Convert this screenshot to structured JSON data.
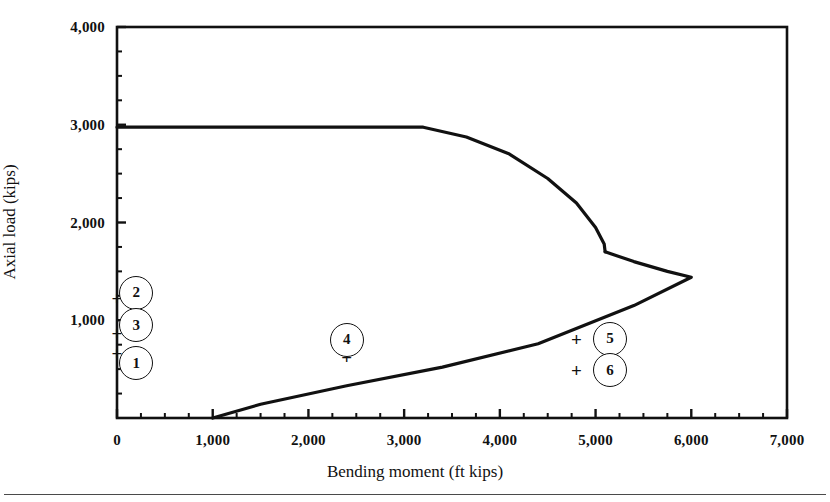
{
  "chart_data": {
    "type": "line",
    "title": "",
    "subtitle": "",
    "xlabel": "Bending moment (ft kips)",
    "ylabel": "Axial load (kips)",
    "xlim": [
      0,
      7000
    ],
    "ylim": [
      0,
      4000
    ],
    "xticks": [
      0,
      1000,
      2000,
      3000,
      4000,
      5000,
      6000,
      7000
    ],
    "xtick_labels": [
      "0",
      "1,000",
      "2,000",
      "3,000",
      "4,000",
      "5,000",
      "6,000",
      "7,000"
    ],
    "yticks": [
      1000,
      2000,
      3000,
      4000
    ],
    "ytick_labels": [
      "1,000",
      "2,000",
      "3,000",
      "4,000"
    ],
    "y_minor_tick_step": 250,
    "x_minor_tick_step": 250,
    "grid": false,
    "legend": null,
    "series": [
      {
        "name": "Column interaction diagram - compression branch",
        "points": [
          [
            0,
            2975
          ],
          [
            1600,
            2975
          ],
          [
            3200,
            2975
          ],
          [
            3650,
            2875
          ],
          [
            4100,
            2700
          ],
          [
            4500,
            2450
          ],
          [
            4800,
            2200
          ],
          [
            5000,
            1950
          ],
          [
            5090,
            1780
          ],
          [
            5100,
            1700
          ]
        ]
      },
      {
        "name": "Column interaction diagram - balance to pure bending branch",
        "points": [
          [
            5100,
            1700
          ],
          [
            5400,
            1600
          ],
          [
            5750,
            1500
          ],
          [
            6000,
            1440
          ],
          [
            5400,
            1150
          ],
          [
            4400,
            760
          ],
          [
            3400,
            520
          ],
          [
            2400,
            330
          ],
          [
            1500,
            140
          ],
          [
            1000,
            0
          ]
        ]
      }
    ],
    "annotations": [
      {
        "id": "1",
        "label": "1",
        "x": 200,
        "y": 560,
        "plus_x": 0,
        "plus_y": 660
      },
      {
        "id": "2",
        "label": "2",
        "x": 200,
        "y": 1280,
        "plus_x": 0,
        "plus_y": 1230
      },
      {
        "id": "3",
        "label": "3",
        "x": 200,
        "y": 950,
        "plus_x": 0,
        "plus_y": 870
      },
      {
        "id": "4",
        "label": "4",
        "x": 2400,
        "y": 800,
        "plus_x": 2400,
        "plus_y": 620
      },
      {
        "id": "5",
        "label": "5",
        "x": 5150,
        "y": 810,
        "plus_x": 4800,
        "plus_y": 810
      },
      {
        "id": "6",
        "label": "6",
        "x": 5150,
        "y": 490,
        "plus_x": 4800,
        "plus_y": 490
      }
    ]
  },
  "figure": {
    "x_axis_title": "Bending moment (ft kips)",
    "y_axis_title": "Axial load (kips)",
    "xtick_labels": [
      "0",
      "1,000",
      "2,000",
      "3,000",
      "4,000",
      "5,000",
      "6,000",
      "7,000"
    ],
    "ytick_labels": [
      "1,000",
      "2,000",
      "3,000",
      "4,000"
    ],
    "marker_labels": [
      "1",
      "2",
      "3",
      "4",
      "5",
      "6"
    ],
    "plus_glyph": "+",
    "curve_color": "#111111",
    "frame_color": "#111111",
    "background_color": "#ffffff"
  }
}
